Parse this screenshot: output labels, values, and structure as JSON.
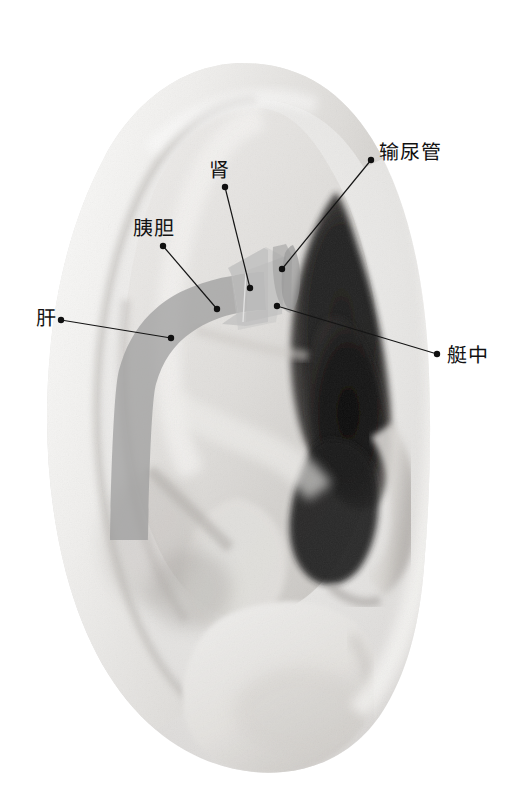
{
  "figure": {
    "background_color": "#ffffff",
    "width": 515,
    "height": 811
  },
  "style": {
    "leader_color": "#141414",
    "leader_width": 1.2,
    "dot_color": "#101010",
    "dot_radius": 3.2,
    "label_color": "#111111",
    "label_font_size": 20
  },
  "regions": [
    {
      "id": "liver",
      "name": "肝",
      "fill": "#9b9b9b",
      "opacity": 0.72
    },
    {
      "id": "pancreas-gallbladder",
      "name": "胰胆",
      "fill": "#a0a0a0",
      "opacity": 0.7
    },
    {
      "id": "kidney",
      "name": "肾",
      "fill": "#b9b9b9",
      "opacity": 0.6
    },
    {
      "id": "bladder",
      "name": "艇中",
      "fill": "#bcbcbc",
      "opacity": 0.6
    },
    {
      "id": "ureter",
      "name": "输尿管",
      "fill": "#8f8f8f",
      "opacity": 0.62
    }
  ],
  "annotations": [
    {
      "id": "ureter",
      "label": "输尿管",
      "label_x": 379,
      "label_y": 142,
      "dot_x": 371,
      "dot_y": 160,
      "tip_x": 282,
      "tip_y": 269,
      "tip_dot": true
    },
    {
      "id": "kidney",
      "label": "肾",
      "label_x": 209,
      "label_y": 160,
      "dot_x": 225,
      "dot_y": 187,
      "tip_x": 250,
      "tip_y": 288,
      "tip_dot": true
    },
    {
      "id": "pancreas-gallbladder",
      "label": "胰胆",
      "label_x": 133,
      "label_y": 218,
      "dot_x": 163,
      "dot_y": 246,
      "tip_x": 217,
      "tip_y": 309,
      "tip_dot": true
    },
    {
      "id": "liver",
      "label": "肝",
      "label_x": 36,
      "label_y": 308,
      "dot_x": 61,
      "dot_y": 320,
      "tip_x": 171,
      "tip_y": 338,
      "tip_dot": true
    },
    {
      "id": "bladder",
      "label": "艇中",
      "label_x": 447,
      "label_y": 345,
      "dot_x": 437,
      "dot_y": 354,
      "tip_x": 277,
      "tip_y": 306,
      "tip_dot": true
    }
  ]
}
